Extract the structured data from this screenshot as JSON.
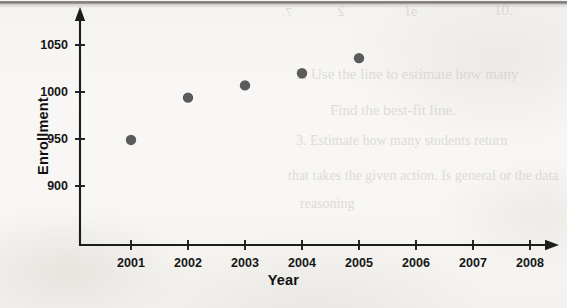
{
  "page": {
    "width": 567,
    "height": 308,
    "background_color": "#f7f6f4",
    "scan_artifacts": {
      "top_edge_band_color": "#696867",
      "bleed_through_color": "#c9c6c0"
    }
  },
  "bleed_through_text": [
    {
      "text": "10.",
      "left": 494,
      "top": 2,
      "size": 15,
      "mirrored": false
    },
    {
      "text": "1e",
      "left": 404,
      "top": 4,
      "size": 14,
      "mirrored": false
    },
    {
      "text": "2",
      "left": 345,
      "top": 3,
      "size": 15,
      "mirrored": true
    },
    {
      "text": "7.",
      "left": 292,
      "top": 4,
      "size": 13,
      "mirrored": true
    },
    {
      "text": "2. Use the line to estimate how many",
      "left": 296,
      "top": 66,
      "size": 15,
      "mirrored": false
    },
    {
      "text": "Find the best-fit line.",
      "left": 330,
      "top": 102,
      "size": 15,
      "mirrored": false
    },
    {
      "text": "3. Estimate how many students return",
      "left": 296,
      "top": 133,
      "size": 14,
      "mirrored": false
    },
    {
      "text": "that takes the given action. Is general or the data",
      "left": 288,
      "top": 168,
      "size": 14,
      "mirrored": false
    },
    {
      "text": "reasoning",
      "left": 300,
      "top": 196,
      "size": 14,
      "mirrored": false
    }
  ],
  "chart_data": {
    "type": "scatter",
    "title": "",
    "xlabel": "Year",
    "ylabel": "Enrollment",
    "x": [
      2001,
      2002,
      2003,
      2004,
      2005
    ],
    "values": [
      949,
      994,
      1007,
      1020,
      1036
    ],
    "series": [
      {
        "name": "Enrollment",
        "points": [
          {
            "x": 2001,
            "y": 949
          },
          {
            "x": 2002,
            "y": 994
          },
          {
            "x": 2003,
            "y": 1007
          },
          {
            "x": 2004,
            "y": 1020
          },
          {
            "x": 2005,
            "y": 1036
          }
        ]
      }
    ],
    "xticks": [
      2001,
      2002,
      2003,
      2004,
      2005,
      2006,
      2007,
      2008
    ],
    "xtick_labels": [
      "2001",
      "2002",
      "2003",
      "2004",
      "2005",
      "2006",
      "2007",
      "2008"
    ],
    "yticks": [
      900,
      950,
      1000,
      1050
    ],
    "ytick_labels": [
      "900",
      "950",
      "1000",
      "1050"
    ],
    "xlim": [
      2000.5,
      2008.6
    ],
    "ylim": [
      875,
      1072
    ],
    "grid": false,
    "legend": false,
    "marker_color": "#5b5b5b",
    "axis_color": "#1c1c1c",
    "axis_style": "arrow-tipped-L"
  },
  "geometry": {
    "axis_x_px": 80,
    "axis_y_px": 245,
    "x_first_tick_px": 131,
    "x_tick_spacing_px": 57,
    "y_tick_top_px": 45,
    "y_tick_spacing_px": 47,
    "marker_radius_px": 5.2
  }
}
